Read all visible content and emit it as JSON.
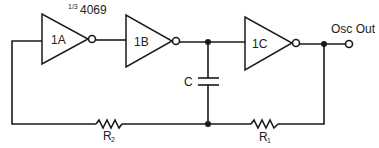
{
  "diagram": {
    "type": "circuit-schematic",
    "part_label": "1/3 4069",
    "part_label_fraction": "1/3",
    "part_label_number": "4069",
    "gates": [
      {
        "id": "1A",
        "label": "1A",
        "type": "inverter"
      },
      {
        "id": "1B",
        "label": "1B",
        "type": "inverter"
      },
      {
        "id": "1C",
        "label": "1C",
        "type": "inverter"
      }
    ],
    "components": {
      "capacitor": {
        "label": "C"
      },
      "resistor_1": {
        "label": "R",
        "subscript": "1"
      },
      "resistor_2": {
        "label": "R",
        "subscript": "2"
      }
    },
    "output": {
      "label": "Osc Out"
    }
  }
}
